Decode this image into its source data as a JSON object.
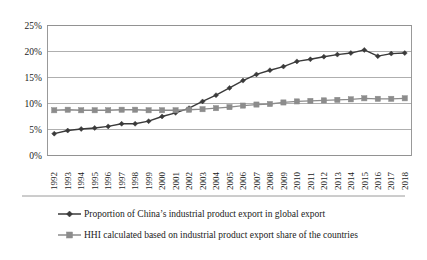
{
  "chart_data": {
    "type": "line",
    "title": "",
    "subtitle": "",
    "xlabel": "",
    "ylabel": "",
    "grid": true,
    "legend_position": "bottom",
    "ylim": [
      0,
      25
    ],
    "ytick_values": [
      0,
      5,
      10,
      15,
      20,
      25
    ],
    "ytick_labels": [
      "0%",
      "5%",
      "10%",
      "15%",
      "20%",
      "25%"
    ],
    "categories": [
      "1992",
      "1993",
      "1994",
      "1995",
      "1996",
      "1997",
      "1998",
      "1999",
      "2000",
      "2001",
      "2002",
      "2003",
      "2004",
      "2005",
      "2006",
      "2007",
      "2008",
      "2009",
      "2010",
      "2011",
      "2012",
      "2013",
      "2014",
      "2015",
      "2016",
      "2017",
      "2018"
    ],
    "series": [
      {
        "name": "Proportion of China’s industrial product export in global export",
        "color": "#3a3a3a",
        "marker": "diamond",
        "values": [
          4.2,
          4.8,
          5.1,
          5.3,
          5.6,
          6.1,
          6.1,
          6.6,
          7.5,
          8.2,
          9.1,
          10.4,
          11.6,
          13.0,
          14.4,
          15.6,
          16.4,
          17.1,
          18.1,
          18.5,
          19.0,
          19.4,
          19.7,
          20.3,
          19.1,
          19.6,
          19.7
        ]
      },
      {
        "name": "HHI calculated based on industrial product export share of the countries",
        "color": "#8c8c8c",
        "marker": "square",
        "values": [
          8.7,
          8.8,
          8.7,
          8.7,
          8.7,
          8.8,
          8.8,
          8.7,
          8.7,
          8.7,
          8.8,
          8.9,
          9.1,
          9.3,
          9.6,
          9.8,
          9.9,
          10.2,
          10.4,
          10.5,
          10.6,
          10.7,
          10.8,
          11.0,
          10.9,
          10.9,
          11.0
        ]
      }
    ],
    "legend": [
      {
        "label": "Proportion of China’s industrial product export in global export",
        "color": "#3a3a3a",
        "marker": "diamond"
      },
      {
        "label": "HHI calculated based on industrial product export share of the countries",
        "color": "#8c8c8c",
        "marker": "square"
      }
    ]
  }
}
